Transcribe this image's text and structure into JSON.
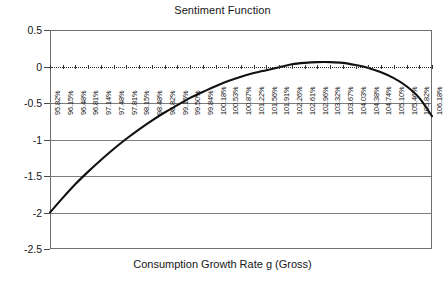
{
  "chart_data": {
    "type": "line",
    "title": "Sentiment Function",
    "xlabel": "Consumption Growth Rate g (Gross)",
    "ylabel": "",
    "ylim": [
      -2.5,
      0.5
    ],
    "ytick_labels": [
      "0.5",
      "0",
      "-0.5",
      "-1",
      "-1.5",
      "-2",
      "-2.5"
    ],
    "ytick_values": [
      0.5,
      0,
      -0.5,
      -1,
      -1.5,
      -2,
      -2.5
    ],
    "grid": true,
    "legend": null,
    "zero_reference_line": 0,
    "categories": [
      "95.82%",
      "96.15%",
      "96.48%",
      "96.81%",
      "97.14%",
      "97.48%",
      "97.81%",
      "98.15%",
      "98.48%",
      "98.82%",
      "99.16%",
      "99.50%",
      "99.84%",
      "100.18%",
      "100.53%",
      "100.87%",
      "101.22%",
      "101.56%",
      "101.91%",
      "102.26%",
      "102.61%",
      "102.96%",
      "103.32%",
      "103.67%",
      "104.03%",
      "104.38%",
      "104.74%",
      "105.10%",
      "105.46%",
      "105.82%",
      "106.18%"
    ],
    "values": [
      -2.0,
      -1.8,
      -1.61,
      -1.44,
      -1.28,
      -1.13,
      -0.99,
      -0.86,
      -0.74,
      -0.63,
      -0.53,
      -0.43,
      -0.35,
      -0.27,
      -0.2,
      -0.14,
      -0.09,
      -0.05,
      -0.01,
      0.03,
      0.05,
      0.06,
      0.06,
      0.05,
      0.02,
      -0.02,
      -0.08,
      -0.16,
      -0.27,
      -0.43,
      -0.68
    ],
    "series_color": "#111111",
    "axis_color": "#6e6e6e",
    "grid_color": "#7d7d7d"
  }
}
